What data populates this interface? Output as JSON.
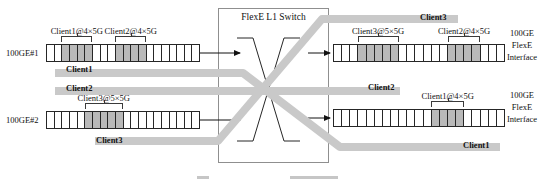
{
  "title": "FlexE L1 Switch",
  "colors": {
    "band": "#c9c9c9",
    "slot_used": "#b9b9b9",
    "slot_free": "#ffffff",
    "line": "#262626",
    "box_border": "#8f8f8f"
  },
  "ports_left": [
    {
      "label": "100GE#1",
      "cells": 20,
      "allocations": [
        {
          "label": "Client1@4×5G",
          "start": 2,
          "count": 4
        },
        {
          "label": "Client2@4×5G",
          "start": 9,
          "count": 4
        }
      ]
    },
    {
      "label": "100GE#2",
      "cells": 20,
      "allocations": [
        {
          "label": "Client3@5×5G",
          "start": 5,
          "count": 5
        }
      ]
    }
  ],
  "ports_right": [
    {
      "label_lines": [
        "100GE",
        "FlexE",
        "Interface"
      ],
      "cells": 21,
      "allocations": [
        {
          "label": "Client3@5×5G",
          "start": 3,
          "count": 5
        },
        {
          "label": "Client2@4×5G",
          "start": 14,
          "count": 4
        }
      ]
    },
    {
      "label_lines": [
        "100GE",
        "FlexE",
        "Interface"
      ],
      "cells": 21,
      "allocations": [
        {
          "label": "Client1@4×5G",
          "start": 12,
          "count": 4
        }
      ]
    }
  ],
  "flow_labels": {
    "client1_left": "Client1",
    "client2_left": "Client2",
    "client3_left": "Client3",
    "client3_right": "Client3",
    "client2_right": "Client2",
    "client1_right": "Client1"
  }
}
